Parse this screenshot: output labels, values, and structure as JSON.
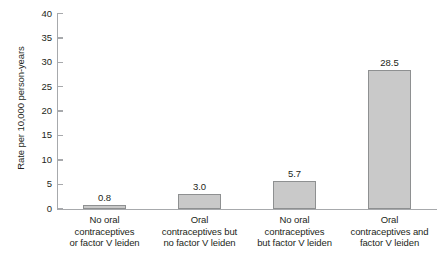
{
  "chart_data": {
    "type": "bar",
    "title": "",
    "xlabel": "",
    "ylabel": "Rate per 10,000 person-years",
    "ylim": [
      0,
      40
    ],
    "yticks": [
      0,
      5,
      10,
      15,
      20,
      25,
      30,
      35,
      40
    ],
    "ytick_labels": [
      "0",
      "5",
      "10",
      "15",
      "20",
      "25",
      "30",
      "35",
      "40"
    ],
    "grid": false,
    "legend": "none",
    "categories": [
      "No oral contraceptives or factor V leiden",
      "Oral contraceptives but no factor V leiden",
      "No oral contraceptives but factor V leiden",
      "Oral contraceptives and factor V leiden"
    ],
    "category_lines": [
      [
        "No oral",
        "contraceptives",
        "or factor V leiden"
      ],
      [
        "Oral",
        "contraceptives but",
        "no factor V leiden"
      ],
      [
        "No oral",
        "contraceptives",
        "but factor V leiden"
      ],
      [
        "Oral",
        "contraceptives and",
        "factor V leiden"
      ]
    ],
    "values": [
      0.8,
      3.0,
      5.7,
      28.5
    ],
    "value_labels": [
      "0.8",
      "3.0",
      "5.7",
      "28.5"
    ],
    "colors": {
      "bar_fill": "#c9c9c9",
      "bar_border": "#8e9091",
      "axis": "#a7a9ac",
      "text": "#231f20",
      "background": "#ffffff"
    }
  }
}
